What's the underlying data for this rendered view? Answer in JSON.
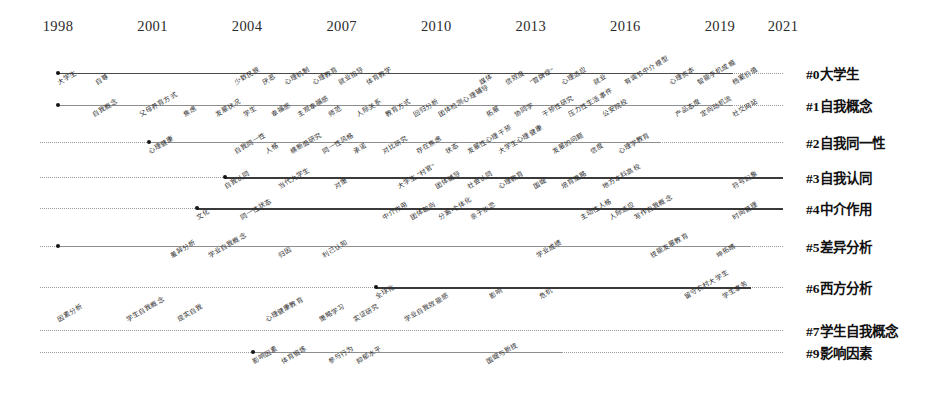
{
  "chart_data": {
    "type": "line",
    "title": "",
    "xlabel": "",
    "ylabel": "",
    "grid": false,
    "legend_position": "right",
    "xlim": [
      1998,
      2021
    ],
    "year_ticks": [
      "1998",
      "2001",
      "2004",
      "2007",
      "2010",
      "2013",
      "2016",
      "2019",
      "2021"
    ],
    "series": [
      {
        "name": "#0大学生",
        "line_start_year": 1998,
        "line_end_year": 2019.4,
        "dotted_tail": true,
        "weight": "solid-mid",
        "keywords": [
          {
            "label": "大学生",
            "year": 1998.0,
            "side": "below"
          },
          {
            "label": "自尊",
            "year": 1999.2,
            "side": "below"
          },
          {
            "label": "少数民族",
            "year": 2003.6,
            "side": "below"
          },
          {
            "label": "厌恶",
            "year": 2004.5,
            "side": "below"
          },
          {
            "label": "心理机制",
            "year": 2005.2,
            "side": "below"
          },
          {
            "label": "心理教育",
            "year": 2006.1,
            "side": "below"
          },
          {
            "label": "就业指导",
            "year": 2006.9,
            "side": "below"
          },
          {
            "label": "体育教学",
            "year": 2007.8,
            "side": "below"
          },
          {
            "label": "媒体",
            "year": 2011.4,
            "side": "below"
          },
          {
            "label": "信效度",
            "year": 2012.2,
            "side": "below"
          },
          {
            "label": "\"冒牌症\"",
            "year": 2013.0,
            "side": "below"
          },
          {
            "label": "心理适应",
            "year": 2014.0,
            "side": "below"
          },
          {
            "label": "就业",
            "year": 2015.0,
            "side": "below"
          },
          {
            "label": "有调节中介模型",
            "year": 2016.0,
            "side": "below"
          },
          {
            "label": "心理资本",
            "year": 2017.4,
            "side": "below"
          },
          {
            "label": "智能手机成瘾",
            "year": 2018.3,
            "side": "below"
          },
          {
            "label": "档案价值",
            "year": 2019.4,
            "side": "below"
          }
        ]
      },
      {
        "name": "#1自我概念",
        "line_start_year": 1998.0,
        "line_end_year": 2019.4,
        "dotted_tail": true,
        "weight": "solid-thin",
        "keywords": [
          {
            "label": "自我概念",
            "year": 1999.1,
            "side": "below"
          },
          {
            "label": "父母养育方式",
            "year": 2000.6,
            "side": "below"
          },
          {
            "label": "焦虑",
            "year": 2002.0,
            "side": "below"
          },
          {
            "label": "发展状况",
            "year": 2003.0,
            "side": "below"
          },
          {
            "label": "学生",
            "year": 2003.9,
            "side": "below"
          },
          {
            "label": "幸福感",
            "year": 2004.8,
            "side": "below"
          },
          {
            "label": "主观幸福感",
            "year": 2005.6,
            "side": "below"
          },
          {
            "label": "师范",
            "year": 2006.6,
            "side": "below"
          },
          {
            "label": "人际关系",
            "year": 2007.5,
            "side": "below"
          },
          {
            "label": "教育方式",
            "year": 2008.4,
            "side": "below"
          },
          {
            "label": "回归分析",
            "year": 2009.3,
            "side": "below"
          },
          {
            "label": "团体检测心理辅导",
            "year": 2010.1,
            "side": "below"
          },
          {
            "label": "拓展",
            "year": 2011.6,
            "side": "below"
          },
          {
            "label": "协同学",
            "year": 2012.5,
            "side": "below"
          },
          {
            "label": "干预性研究",
            "year": 2013.4,
            "side": "below"
          },
          {
            "label": "压力性生活事件",
            "year": 2014.2,
            "side": "below"
          },
          {
            "label": "公安院校",
            "year": 2015.3,
            "side": "below"
          },
          {
            "label": "产品态度",
            "year": 2017.6,
            "side": "below"
          },
          {
            "label": "定向动机流",
            "year": 2018.4,
            "side": "below"
          },
          {
            "label": "社交网站",
            "year": 2019.4,
            "side": "below"
          }
        ]
      },
      {
        "name": "#2自我同一性",
        "line_start_year": 2000.9,
        "line_end_year": 2017.1,
        "dotted_tail": true,
        "weight": "solid-thin",
        "keywords": [
          {
            "label": "心理健康",
            "year": 2000.9,
            "side": "below"
          },
          {
            "label": "自我同一性",
            "year": 2003.6,
            "side": "below"
          },
          {
            "label": "人格",
            "year": 2004.6,
            "side": "below"
          },
          {
            "label": "横断面研究",
            "year": 2005.4,
            "side": "below"
          },
          {
            "label": "同一性风格",
            "year": 2006.4,
            "side": "below"
          },
          {
            "label": "承诺",
            "year": 2007.4,
            "side": "below"
          },
          {
            "label": "对比研究",
            "year": 2008.3,
            "side": "below"
          },
          {
            "label": "存在焦虑",
            "year": 2009.4,
            "side": "below"
          },
          {
            "label": "状态",
            "year": 2010.3,
            "side": "below"
          },
          {
            "label": "发展性心理干预",
            "year": 2011.0,
            "side": "below"
          },
          {
            "label": "大学生心理健康",
            "year": 2012.0,
            "side": "below"
          },
          {
            "label": "发展的问题",
            "year": 2013.7,
            "side": "below"
          },
          {
            "label": "信度",
            "year": 2014.9,
            "side": "below"
          },
          {
            "label": "心理学教育",
            "year": 2015.8,
            "side": "below"
          }
        ]
      },
      {
        "name": "#3自我认同",
        "line_start_year": 2003.3,
        "line_end_year": 2021.0,
        "dotted_tail": false,
        "weight": "solid-thick",
        "keywords": [
          {
            "label": "自我认同",
            "year": 2003.3,
            "side": "below"
          },
          {
            "label": "当代大学生",
            "year": 2005.0,
            "side": "below"
          },
          {
            "label": "对策",
            "year": 2006.8,
            "side": "below"
          },
          {
            "label": "大学生 \"村官\"",
            "year": 2008.8,
            "side": "below"
          },
          {
            "label": "团体辅导",
            "year": 2010.0,
            "side": "below"
          },
          {
            "label": "社会认同",
            "year": 2011.0,
            "side": "below"
          },
          {
            "label": "心理教育",
            "year": 2012.0,
            "side": "below"
          },
          {
            "label": "国嫂",
            "year": 2013.1,
            "side": "below"
          },
          {
            "label": "培育策略",
            "year": 2014.0,
            "side": "below"
          },
          {
            "label": "地方本科高校",
            "year": 2015.3,
            "side": "below"
          },
          {
            "label": "符号幻象",
            "year": 2019.4,
            "side": "below"
          }
        ]
      },
      {
        "name": "#4中介作用",
        "line_start_year": 2002.4,
        "line_end_year": 2021.0,
        "dotted_tail": false,
        "weight": "solid-thick",
        "keywords": [
          {
            "label": "文化",
            "year": 2002.4,
            "side": "below"
          },
          {
            "label": "同一性状态",
            "year": 2003.8,
            "side": "below"
          },
          {
            "label": "中介作用",
            "year": 2008.3,
            "side": "below"
          },
          {
            "label": "团体取向",
            "year": 2009.2,
            "side": "below"
          },
          {
            "label": "分离-个体化",
            "year": 2010.1,
            "side": "below"
          },
          {
            "label": "亲子依恋",
            "year": 2011.1,
            "side": "below"
          },
          {
            "label": "主动性人格",
            "year": 2014.6,
            "side": "below"
          },
          {
            "label": "人际适应",
            "year": 2015.5,
            "side": "below"
          },
          {
            "label": "写作自我概念",
            "year": 2016.3,
            "side": "below"
          },
          {
            "label": "时间管理",
            "year": 2019.4,
            "side": "below"
          }
        ]
      },
      {
        "name": "#5差异分析",
        "line_start_year": 1998.0,
        "line_end_year": 2020.0,
        "dotted_tail": false,
        "weight": "solid-thin",
        "keywords": [
          {
            "label": "差异分析",
            "year": 2001.6,
            "side": "below"
          },
          {
            "label": "学业自我概念",
            "year": 2002.8,
            "side": "below"
          },
          {
            "label": "归因",
            "year": 2005.0,
            "side": "below"
          },
          {
            "label": "利己认知",
            "year": 2006.4,
            "side": "below"
          },
          {
            "label": "学业成绩",
            "year": 2013.2,
            "side": "below"
          },
          {
            "label": "技能发展教育",
            "year": 2016.8,
            "side": "below"
          },
          {
            "label": "坤拓晴",
            "year": 2018.9,
            "side": "below"
          }
        ]
      },
      {
        "name": "#6西方分析",
        "line_start_year": 2008.1,
        "line_end_year": 2020.0,
        "dotted_tail": false,
        "weight": "solid-thick",
        "keywords": [
          {
            "label": "全球化",
            "year": 2008.1,
            "side": "below"
          },
          {
            "label": "影响",
            "year": 2011.7,
            "side": "below"
          },
          {
            "label": "危机",
            "year": 2013.3,
            "side": "below"
          },
          {
            "label": "留守农村大学生",
            "year": 2017.9,
            "side": "below"
          },
          {
            "label": "学生事务",
            "year": 2019.1,
            "side": "below"
          }
        ]
      },
      {
        "name": "#7学生自我概念",
        "line_start_year": 1998.0,
        "line_end_year": 2020.5,
        "dotted_tail": false,
        "weight": "dotted",
        "keywords": [
          {
            "label": "因素分析",
            "year": 1998.0,
            "side": "above"
          },
          {
            "label": "学生自我概念",
            "year": 2000.2,
            "side": "above"
          },
          {
            "label": "现实自我",
            "year": 2001.8,
            "side": "above"
          },
          {
            "label": "心理健康教育",
            "year": 2004.6,
            "side": "above"
          },
          {
            "label": "策略学习",
            "year": 2006.3,
            "side": "above"
          },
          {
            "label": "实证研究",
            "year": 2007.4,
            "side": "above"
          },
          {
            "label": "学业自我效能感",
            "year": 2009.0,
            "side": "above"
          }
        ]
      },
      {
        "name": "#9影响因素",
        "line_start_year": 2004.2,
        "line_end_year": 2014.0,
        "dotted_tail": false,
        "weight": "solid-thin",
        "keywords": [
          {
            "label": "影响因素",
            "year": 2004.2,
            "side": "below"
          },
          {
            "label": "体育锻炼",
            "year": 2005.1,
            "side": "below"
          },
          {
            "label": "参与行为",
            "year": 2006.6,
            "side": "below"
          },
          {
            "label": "抑郁水平",
            "year": 2007.5,
            "side": "below"
          },
          {
            "label": "国嫂与新技",
            "year": 2011.6,
            "side": "below"
          }
        ]
      }
    ]
  },
  "layout": {
    "x_start_px": 58,
    "x_end_px": 783,
    "year_start": 1998,
    "year_end": 2021,
    "row_y_px": [
      73,
      105,
      142,
      177,
      208,
      246,
      287,
      330,
      352
    ],
    "row_dotted_left_px": [
      58,
      58,
      40,
      40,
      40,
      40,
      40,
      40,
      40
    ],
    "row_dotted_right_px": [
      783,
      783,
      783,
      783,
      783,
      783,
      783,
      783,
      783
    ]
  }
}
